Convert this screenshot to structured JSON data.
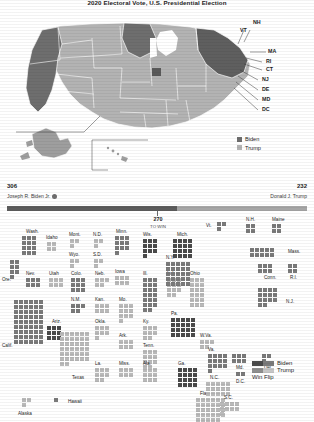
{
  "title": "2020 Electoral Vote, U.S. Presidential Election",
  "colors": {
    "biden": "#7a7a7a",
    "trump": "#b9b9b9",
    "flip": "#4a4a4a",
    "bar_biden": "#5d5d5d",
    "bar_trump": "#a6a6a6",
    "ink": "#1d1d1d"
  },
  "map": {
    "callout_labels": [
      "NH",
      "VT",
      "MA",
      "RI",
      "CT",
      "NJ",
      "DE",
      "MD",
      "DC"
    ],
    "legend": [
      {
        "label": "Biden",
        "color": "#6e6e6e"
      },
      {
        "label": "Trump",
        "color": "#b3b3b3"
      }
    ]
  },
  "electoral_bar": {
    "biden_votes": "306",
    "biden_name": "Joseph R. Biden Jr.",
    "trump_votes": "232",
    "trump_name": "Donald J. Trump",
    "threshold": "270",
    "threshold_sub": "TO WIN",
    "winner_marker": "winner-check"
  },
  "cartogram": {
    "legend": [
      {
        "label": "Biden"
      },
      {
        "label": "Trump"
      },
      {
        "label": "Win Flip"
      }
    ],
    "states": [
      {
        "abbr": "Wash.",
        "label_x": 26,
        "label_y": 16,
        "x": 22,
        "y": 22,
        "cols": 3,
        "rows": 4,
        "n": 12,
        "party": "biden",
        "label_pos": "top"
      },
      {
        "abbr": "Ore.",
        "label_x": 2,
        "label_y": 64,
        "x": 10,
        "y": 46,
        "cols": 2,
        "rows": 4,
        "n": 7,
        "party": "biden",
        "label_pos": "left"
      },
      {
        "abbr": "Idaho",
        "label_x": 46,
        "label_y": 22,
        "x": 47,
        "y": 28,
        "cols": 2,
        "rows": 2,
        "n": 4,
        "party": "trump",
        "label_pos": "top"
      },
      {
        "abbr": "Mont.",
        "label_x": 69,
        "label_y": 19,
        "x": 70,
        "y": 25,
        "cols": 2,
        "rows": 2,
        "n": 3,
        "party": "trump",
        "label_pos": "top"
      },
      {
        "abbr": "Wyo.",
        "label_x": 69,
        "label_y": 39,
        "x": 70,
        "y": 45,
        "cols": 2,
        "rows": 2,
        "n": 3,
        "party": "trump",
        "label_pos": "top"
      },
      {
        "abbr": "N.D.",
        "label_x": 93,
        "label_y": 19,
        "x": 94,
        "y": 25,
        "cols": 2,
        "rows": 2,
        "n": 3,
        "party": "trump",
        "label_pos": "top"
      },
      {
        "abbr": "S.D.",
        "label_x": 93,
        "label_y": 39,
        "x": 94,
        "y": 45,
        "cols": 2,
        "rows": 2,
        "n": 3,
        "party": "trump",
        "label_pos": "top"
      },
      {
        "abbr": "Minn.",
        "label_x": 116,
        "label_y": 16,
        "x": 115,
        "y": 22,
        "cols": 3,
        "rows": 4,
        "n": 10,
        "party": "biden",
        "label_pos": "top"
      },
      {
        "abbr": "Iowa",
        "label_x": 115,
        "label_y": 56,
        "x": 115,
        "y": 62,
        "cols": 3,
        "rows": 2,
        "n": 6,
        "party": "trump",
        "label_pos": "top"
      },
      {
        "abbr": "Wis.",
        "label_x": 143,
        "label_y": 19,
        "x": 143,
        "y": 25,
        "cols": 3,
        "rows": 4,
        "n": 10,
        "party": "flip",
        "label_pos": "top"
      },
      {
        "abbr": "Mich.",
        "label_x": 177,
        "label_y": 19,
        "x": 173,
        "y": 25,
        "cols": 4,
        "rows": 4,
        "n": 16,
        "party": "flip",
        "label_pos": "top"
      },
      {
        "abbr": "Nev.",
        "label_x": 26,
        "label_y": 58,
        "x": 26,
        "y": 64,
        "cols": 3,
        "rows": 2,
        "n": 6,
        "party": "biden",
        "label_pos": "top"
      },
      {
        "abbr": "Utah",
        "label_x": 49,
        "label_y": 58,
        "x": 49,
        "y": 64,
        "cols": 3,
        "rows": 2,
        "n": 6,
        "party": "trump",
        "label_pos": "top"
      },
      {
        "abbr": "Colo.",
        "label_x": 71,
        "label_y": 58,
        "x": 71,
        "y": 64,
        "cols": 3,
        "rows": 3,
        "n": 9,
        "party": "biden",
        "label_pos": "top"
      },
      {
        "abbr": "N.M.",
        "label_x": 71,
        "label_y": 84,
        "x": 71,
        "y": 90,
        "cols": 3,
        "rows": 2,
        "n": 5,
        "party": "biden",
        "label_pos": "top"
      },
      {
        "abbr": "Neb.",
        "label_x": 95,
        "label_y": 58,
        "x": 95,
        "y": 64,
        "cols": 3,
        "rows": 2,
        "n": 5,
        "party": "trump",
        "label_pos": "top"
      },
      {
        "abbr": "Kan.",
        "label_x": 95,
        "label_y": 84,
        "x": 95,
        "y": 90,
        "cols": 3,
        "rows": 2,
        "n": 6,
        "party": "trump",
        "label_pos": "top"
      },
      {
        "abbr": "Okla.",
        "label_x": 95,
        "label_y": 106,
        "x": 95,
        "y": 112,
        "cols": 3,
        "rows": 3,
        "n": 7,
        "party": "trump",
        "label_pos": "top"
      },
      {
        "abbr": "Mo.",
        "label_x": 119,
        "label_y": 84,
        "x": 119,
        "y": 90,
        "cols": 3,
        "rows": 4,
        "n": 10,
        "party": "trump",
        "label_pos": "top"
      },
      {
        "abbr": "Ill.",
        "label_x": 143,
        "label_y": 58,
        "x": 143,
        "y": 64,
        "cols": 3,
        "rows": 7,
        "n": 20,
        "party": "biden",
        "label_pos": "top"
      },
      {
        "abbr": "Ind.",
        "label_x": 167,
        "label_y": 58,
        "x": 167,
        "y": 64,
        "cols": 3,
        "rows": 4,
        "n": 11,
        "party": "trump",
        "label_pos": "top"
      },
      {
        "abbr": "Ohio",
        "label_x": 190,
        "label_y": 58,
        "x": 190,
        "y": 64,
        "cols": 3,
        "rows": 6,
        "n": 18,
        "party": "trump",
        "label_pos": "top"
      },
      {
        "abbr": "Ky.",
        "label_x": 143,
        "label_y": 106,
        "x": 143,
        "y": 112,
        "cols": 3,
        "rows": 3,
        "n": 8,
        "party": "trump",
        "label_pos": "top"
      },
      {
        "abbr": "Ark.",
        "label_x": 119,
        "label_y": 120,
        "x": 119,
        "y": 126,
        "cols": 3,
        "rows": 2,
        "n": 6,
        "party": "trump",
        "label_pos": "top"
      },
      {
        "abbr": "Tenn.",
        "label_x": 143,
        "label_y": 130,
        "x": 143,
        "y": 136,
        "cols": 3,
        "rows": 4,
        "n": 11,
        "party": "trump",
        "label_pos": "top"
      },
      {
        "abbr": "La.",
        "label_x": 95,
        "label_y": 148,
        "x": 95,
        "y": 154,
        "cols": 3,
        "rows": 3,
        "n": 8,
        "party": "trump",
        "label_pos": "top"
      },
      {
        "abbr": "Miss.",
        "label_x": 119,
        "label_y": 148,
        "x": 119,
        "y": 154,
        "cols": 3,
        "rows": 2,
        "n": 6,
        "party": "trump",
        "label_pos": "top"
      },
      {
        "abbr": "Ala.",
        "label_x": 143,
        "label_y": 148,
        "x": 143,
        "y": 154,
        "cols": 3,
        "rows": 3,
        "n": 9,
        "party": "trump",
        "label_pos": "top"
      },
      {
        "abbr": "Ga.",
        "label_x": 178,
        "label_y": 148,
        "x": 178,
        "y": 154,
        "cols": 4,
        "rows": 4,
        "n": 16,
        "party": "flip",
        "label_pos": "top"
      },
      {
        "abbr": "Fla.",
        "label_x": 200,
        "label_y": 178,
        "x": 196,
        "y": 184,
        "cols": 6,
        "rows": 5,
        "n": 29,
        "party": "trump",
        "label_pos": "top"
      },
      {
        "abbr": "W.Va.",
        "label_x": 200,
        "label_y": 120,
        "x": 200,
        "y": 126,
        "cols": 3,
        "rows": 2,
        "n": 5,
        "party": "trump",
        "label_pos": "top"
      },
      {
        "abbr": "Va.",
        "label_x": 208,
        "label_y": 134,
        "x": 208,
        "y": 140,
        "cols": 4,
        "rows": 4,
        "n": 13,
        "party": "biden",
        "label_pos": "top"
      },
      {
        "abbr": "N.C.",
        "label_x": 210,
        "label_y": 162,
        "x": 206,
        "y": 168,
        "cols": 5,
        "rows": 3,
        "n": 15,
        "party": "trump",
        "label_pos": "top"
      },
      {
        "abbr": "S.C.",
        "label_x": 224,
        "label_y": 182,
        "x": 220,
        "y": 188,
        "cols": 4,
        "rows": 3,
        "n": 9,
        "party": "trump",
        "label_pos": "top"
      },
      {
        "abbr": "Pa.",
        "label_x": 171,
        "label_y": 98,
        "x": 171,
        "y": 104,
        "cols": 5,
        "rows": 4,
        "n": 20,
        "party": "flip",
        "label_pos": "top"
      },
      {
        "abbr": "N.Y.",
        "label_x": 166,
        "label_y": 42,
        "x": 166,
        "y": 48,
        "cols": 5,
        "rows": 5,
        "n": 29,
        "party": "biden",
        "label_pos": "top"
      },
      {
        "abbr": "Vt.",
        "label_x": 206,
        "label_y": 10,
        "x": 217,
        "y": 8,
        "cols": 2,
        "rows": 2,
        "n": 3,
        "party": "biden",
        "label_pos": "left"
      },
      {
        "abbr": "N.H.",
        "label_x": 246,
        "label_y": 4,
        "x": 246,
        "y": 10,
        "cols": 2,
        "rows": 2,
        "n": 4,
        "party": "biden",
        "label_pos": "top"
      },
      {
        "abbr": "Maine",
        "label_x": 272,
        "label_y": 4,
        "x": 272,
        "y": 10,
        "cols": 2,
        "rows": 2,
        "n": 4,
        "party": "biden",
        "label_pos": "top"
      },
      {
        "abbr": "Mass.",
        "label_x": 288,
        "label_y": 36,
        "x": 250,
        "y": 34,
        "cols": 5,
        "rows": 2,
        "n": 11,
        "party": "biden",
        "label_pos": "right"
      },
      {
        "abbr": "Conn.",
        "label_x": 264,
        "label_y": 62,
        "x": 258,
        "y": 50,
        "cols": 3,
        "rows": 2,
        "n": 7,
        "party": "biden",
        "label_pos": "bottom"
      },
      {
        "abbr": "R.I.",
        "label_x": 290,
        "label_y": 62,
        "x": 288,
        "y": 50,
        "cols": 2,
        "rows": 2,
        "n": 4,
        "party": "biden",
        "label_pos": "bottom"
      },
      {
        "abbr": "N.J.",
        "label_x": 286,
        "label_y": 86,
        "x": 258,
        "y": 74,
        "cols": 4,
        "rows": 4,
        "n": 14,
        "party": "biden",
        "label_pos": "right"
      },
      {
        "abbr": "Md.",
        "label_x": 236,
        "label_y": 152,
        "x": 232,
        "y": 140,
        "cols": 3,
        "rows": 2,
        "n": 10,
        "party": "biden",
        "label_pos": "bottom"
      },
      {
        "abbr": "Del.",
        "label_x": 264,
        "label_y": 152,
        "x": 262,
        "y": 140,
        "cols": 2,
        "rows": 2,
        "n": 3,
        "party": "biden",
        "label_pos": "bottom"
      },
      {
        "abbr": "D.C.",
        "label_x": 236,
        "label_y": 166,
        "x": 236,
        "y": 158,
        "cols": 2,
        "rows": 1,
        "n": 3,
        "party": "biden",
        "label_pos": "bottom"
      },
      {
        "abbr": "Ariz.",
        "label_x": 52,
        "label_y": 106,
        "x": 47,
        "y": 112,
        "cols": 3,
        "rows": 3,
        "n": 11,
        "party": "flip",
        "label_pos": "top"
      },
      {
        "abbr": "Calif.",
        "label_x": 2,
        "label_y": 130,
        "x": 14,
        "y": 86,
        "cols": 6,
        "rows": 9,
        "n": 55,
        "party": "biden",
        "label_pos": "left"
      },
      {
        "abbr": "Texas",
        "label_x": 72,
        "label_y": 162,
        "x": 60,
        "y": 118,
        "cols": 6,
        "rows": 7,
        "n": 38,
        "party": "trump",
        "label_pos": "bottom"
      },
      {
        "abbr": "Alaska",
        "label_x": 18,
        "label_y": 198,
        "x": 22,
        "y": 184,
        "cols": 2,
        "rows": 2,
        "n": 3,
        "party": "trump",
        "label_pos": "bottom"
      },
      {
        "abbr": "Hawaii",
        "label_x": 68,
        "label_y": 186,
        "x": 54,
        "y": 184,
        "cols": 1,
        "rows": 1,
        "n": 1,
        "party": "biden",
        "label_pos": "right"
      }
    ]
  }
}
